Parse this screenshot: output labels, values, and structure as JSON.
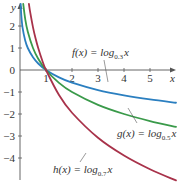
{
  "chart_data": {
    "type": "line",
    "title": "",
    "xlabel": "x",
    "ylabel": "y",
    "xlim": [
      0,
      6
    ],
    "ylim": [
      -5,
      3
    ],
    "x_ticks": [
      1,
      2,
      3,
      4,
      5
    ],
    "y_ticks": [
      2,
      1,
      0,
      -1,
      -2,
      -3,
      -4
    ],
    "grid": false,
    "series": [
      {
        "name": "f(x) = log_0.3 x",
        "label_func": "f(x) = log",
        "label_base": "0.3",
        "label_var": "x",
        "color": "#2b7fc0",
        "x": [
          0.027,
          0.05,
          0.1,
          0.2,
          0.3,
          0.5,
          0.7,
          1,
          1.5,
          2,
          3,
          4,
          5,
          6
        ],
        "y": [
          3.0,
          2.49,
          1.91,
          1.34,
          1.0,
          0.576,
          0.296,
          0,
          -0.337,
          -0.576,
          -0.912,
          -1.151,
          -1.337,
          -1.488
        ]
      },
      {
        "name": "g(x) = log_0.5 x",
        "label_func": "g(x) = log",
        "label_base": "0.5",
        "label_var": "x",
        "color": "#3a9a4a",
        "x": [
          0.125,
          0.2,
          0.3,
          0.5,
          0.7,
          1,
          1.5,
          2,
          3,
          4,
          5,
          6
        ],
        "y": [
          3.0,
          2.32,
          1.74,
          1.0,
          0.515,
          0,
          -0.585,
          -1.0,
          -1.585,
          -2.0,
          -2.32,
          -2.585
        ]
      },
      {
        "name": "h(x) = log_0.7 x",
        "label_func": "h(x) = log",
        "label_base": "0.7",
        "label_var": "x",
        "color": "#a8324a",
        "x": [
          0.343,
          0.4,
          0.5,
          0.6,
          0.7,
          0.85,
          1,
          1.5,
          2,
          3,
          4,
          5,
          6
        ],
        "y": [
          3.0,
          2.57,
          1.94,
          1.43,
          1.0,
          0.456,
          0,
          -1.137,
          -1.943,
          -3.08,
          -3.887,
          -4.51,
          -5.02
        ]
      }
    ],
    "annotations": [
      {
        "text": "f(x) = log_0.3 x",
        "points_to": "f"
      },
      {
        "text": "g(x) = log_0.5 x",
        "points_to": "g"
      },
      {
        "text": "h(x) = log_0.7 x",
        "points_to": "h"
      }
    ]
  }
}
